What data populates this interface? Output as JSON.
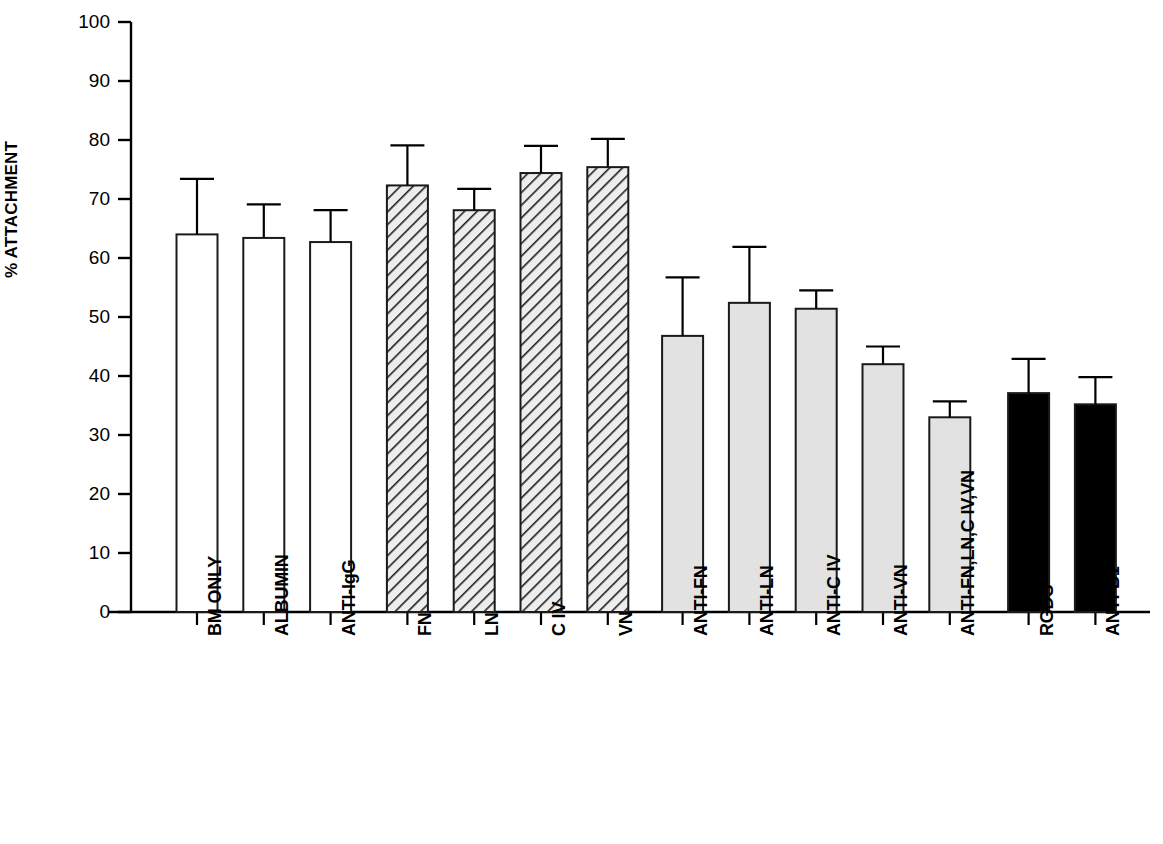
{
  "chart_data": {
    "type": "bar",
    "title": "",
    "subtitle": "",
    "xlabel": "",
    "ylabel": "% ATTACHMENT",
    "ylim": [
      0,
      100
    ],
    "yticks": [
      0,
      10,
      20,
      30,
      40,
      50,
      60,
      70,
      80,
      90,
      100
    ],
    "ytick_labels": [
      "0",
      "10",
      "20",
      "30",
      "40",
      "50",
      "60",
      "70",
      "80",
      "90",
      "100"
    ],
    "grid": false,
    "legend": "none",
    "error_bars": "upper only (SEM)",
    "categories": [
      "BM ONLY",
      "ALBUMIN",
      "ANTI-IgG",
      "FN",
      "LN",
      "C IV",
      "VN",
      "ANTI-FN",
      "ANTI-LN",
      "ANTI-C IV",
      "ANTI-VN",
      "ANTI-FN,LN,C IV,VN",
      "RGDS",
      "ANTI-B1"
    ],
    "values": [
      64.0,
      63.4,
      62.7,
      72.3,
      68.1,
      74.4,
      75.4,
      46.8,
      52.4,
      51.4,
      42.0,
      33.0,
      37.1,
      35.2
    ],
    "errors": [
      9.4,
      5.7,
      5.4,
      6.8,
      3.6,
      4.6,
      4.8,
      9.9,
      9.5,
      3.1,
      3.0,
      2.7,
      5.8,
      4.6
    ],
    "bar_styles": [
      "white",
      "white",
      "white",
      "hatched",
      "hatched",
      "hatched",
      "hatched",
      "gray",
      "gray",
      "gray",
      "gray",
      "gray",
      "black",
      "black"
    ]
  },
  "style": {
    "axis_color": "#000000",
    "bar_outline": "#1a1a1a",
    "fill_white": "#ffffff",
    "fill_gray": "#e2e2e2",
    "fill_hatch_bg": "#ededed",
    "fill_black": "#000000",
    "background": "#ffffff"
  }
}
